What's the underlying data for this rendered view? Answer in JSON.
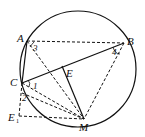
{
  "diagram": {
    "type": "geometry",
    "circle": {
      "cx": 78,
      "cy": 69,
      "r": 58
    },
    "points": {
      "A": {
        "label": "A",
        "x": 27,
        "y": 41
      },
      "B": {
        "label": "B",
        "x": 124,
        "y": 43
      },
      "C": {
        "label": "C",
        "x": 22,
        "y": 83
      },
      "E": {
        "label": "E",
        "x": 62,
        "y": 67
      },
      "M": {
        "label": "M",
        "x": 84,
        "y": 119
      },
      "E1": {
        "label": "E",
        "sub": "1",
        "x": 19,
        "y": 116
      }
    },
    "angle_labels": {
      "a1": "1",
      "a2": "2",
      "a3": "3",
      "a4": "4"
    },
    "solid_segments": [
      "AC",
      "CB",
      "EM"
    ],
    "dashed_segments": [
      "AB",
      "AM",
      "BM",
      "CM",
      "CE1",
      "E1M",
      "C-M(2)"
    ]
  }
}
